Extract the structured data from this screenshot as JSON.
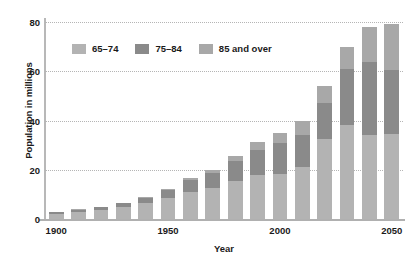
{
  "chart_data": {
    "type": "bar",
    "subtype": "stacked-bar",
    "title": "",
    "xlabel": "Year",
    "ylabel": "Population in millions",
    "categories": [
      1900,
      1910,
      1920,
      1930,
      1940,
      1950,
      1960,
      1970,
      1980,
      1990,
      2000,
      2010,
      2020,
      2030,
      2040,
      2050
    ],
    "series": [
      {
        "name": "65–74",
        "color": "#b3b3b3",
        "values": [
          2.2,
          2.8,
          3.6,
          4.8,
          6.4,
          8.4,
          11.0,
          12.4,
          15.6,
          18.0,
          18.4,
          21.0,
          32.3,
          38.0,
          34.1,
          34.5
        ]
      },
      {
        "name": "75–84",
        "color": "#8a8a8a",
        "values": [
          0.7,
          0.9,
          1.2,
          1.6,
          2.1,
          3.3,
          4.7,
          6.1,
          7.8,
          10.2,
          12.4,
          13.0,
          15.0,
          23.1,
          29.7,
          26.0
        ]
      },
      {
        "name": "85 and over",
        "color": "#a8a8a8",
        "values": [
          0.1,
          0.2,
          0.2,
          0.3,
          0.4,
          0.6,
          0.9,
          1.4,
          2.2,
          3.0,
          4.2,
          5.7,
          6.7,
          8.8,
          14.3,
          18.9
        ]
      }
    ],
    "totals": [
      3.0,
      3.9,
      5.0,
      6.7,
      8.9,
      12.3,
      16.6,
      19.9,
      25.6,
      31.2,
      35.0,
      39.7,
      54.0,
      69.9,
      78.1,
      79.4
    ],
    "y_ticks": [
      0,
      20,
      40,
      60,
      80
    ],
    "ylim": [
      0,
      80
    ],
    "x_ticks": [
      "1900",
      "1950",
      "2000",
      "2050"
    ],
    "x_tick_indices": [
      0,
      5,
      10,
      15
    ],
    "grid": true,
    "grid_style": "dotted-horizontal",
    "legend_position": "top-left-inside",
    "bar_count": 16,
    "background_color": "#ffffff",
    "axis_color": "#b4b4b4",
    "text_color": "#1a1a1a"
  },
  "legend": {
    "items": [
      {
        "label": "65–74",
        "swatch": "#b3b3b3"
      },
      {
        "label": "75–84",
        "swatch": "#8a8a8a"
      },
      {
        "label": "85 and over",
        "swatch": "#a8a8a8"
      }
    ]
  },
  "axes": {
    "y_title": "Population in millions",
    "x_title": "Year",
    "y_labels": [
      "0",
      "20",
      "40",
      "60",
      "80"
    ],
    "x_labels": [
      "1900",
      "1950",
      "2000",
      "2050"
    ]
  }
}
